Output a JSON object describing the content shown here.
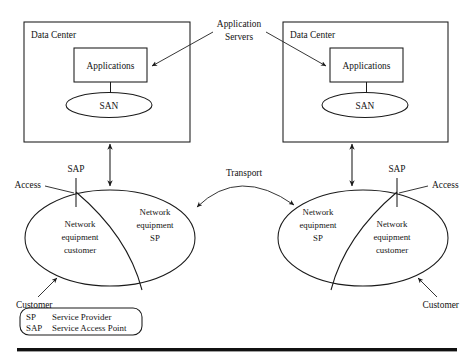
{
  "diagram": {
    "ink_color": "#1a1a1a",
    "background_color": "#ffffff",
    "data_centers": [
      {
        "id": "left",
        "label": "Data Center",
        "app_box_label": "Applications",
        "san_label": "SAN"
      },
      {
        "id": "right",
        "label": "Data Center",
        "app_box_label": "Applications",
        "san_label": "SAN"
      }
    ],
    "application_servers_label": {
      "line1": "Application",
      "line2": "Servers"
    },
    "transport_label": "Transport",
    "networks": [
      {
        "id": "left-network",
        "sap_label": "SAP",
        "access_label": "Access",
        "customer_label": "Customer",
        "customer_region": {
          "line1": "Network",
          "line2": "equipment",
          "line3": "customer"
        },
        "sp_region": {
          "line1": "Network",
          "line2": "equipment",
          "line3": "SP"
        }
      },
      {
        "id": "right-network",
        "sap_label": "SAP",
        "access_label": "Access",
        "customer_label": "Customer",
        "customer_region": {
          "line1": "Network",
          "line2": "equipment",
          "line3": "customer"
        },
        "sp_region": {
          "line1": "Network",
          "line2": "equipment",
          "line3": "SP"
        }
      }
    ],
    "legend": {
      "rows": [
        {
          "abbr": "SP",
          "expansion": "Service Provider"
        },
        {
          "abbr": "SAP",
          "expansion": "Service Access Point"
        }
      ]
    }
  }
}
